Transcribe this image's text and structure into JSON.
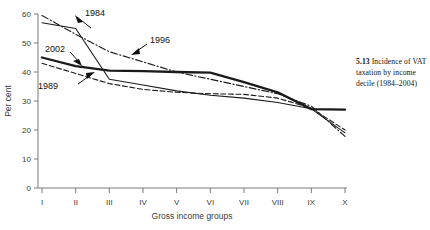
{
  "caption": {
    "number": "5.13",
    "text": "Incidence of VAT taxation by income decile (1984–2004)"
  },
  "chart_data": {
    "type": "line",
    "title": "",
    "xlabel": "Gross income groups",
    "ylabel": "Per cent",
    "categories": [
      "I",
      "II",
      "III",
      "IV",
      "V",
      "VI",
      "VII",
      "VIII",
      "IX",
      "X"
    ],
    "ylim": [
      0,
      60
    ],
    "yticks": [
      0,
      10,
      20,
      30,
      40,
      50,
      60
    ],
    "ytick_labels": [
      "0",
      "10",
      "20",
      "30",
      "40",
      "50",
      "60"
    ],
    "grid": false,
    "legend": "inline-annotations",
    "series": [
      {
        "name": "1984",
        "style": "solid-thin",
        "values": [
          57.0,
          55.0,
          37.5,
          35.5,
          33.5,
          32.0,
          31.0,
          29.5,
          27.3,
          19.0
        ]
      },
      {
        "name": "1989",
        "style": "dashed",
        "values": [
          43.0,
          39.5,
          36.0,
          34.0,
          33.0,
          32.5,
          32.3,
          31.0,
          27.5,
          20.0
        ]
      },
      {
        "name": "1996",
        "style": "dash-dot",
        "values": [
          59.5,
          53.0,
          47.0,
          43.5,
          40.0,
          37.5,
          35.0,
          32.5,
          28.2,
          17.8
        ]
      },
      {
        "name": "2002",
        "style": "solid-thick",
        "values": [
          45.0,
          42.0,
          40.5,
          40.3,
          40.0,
          39.8,
          36.5,
          33.0,
          27.2,
          27.0
        ]
      }
    ],
    "annotations": [
      {
        "label": "1984",
        "series": "1984"
      },
      {
        "label": "2002",
        "series": "2002"
      },
      {
        "label": "1996",
        "series": "1996"
      },
      {
        "label": "1989",
        "series": "1989"
      }
    ]
  }
}
